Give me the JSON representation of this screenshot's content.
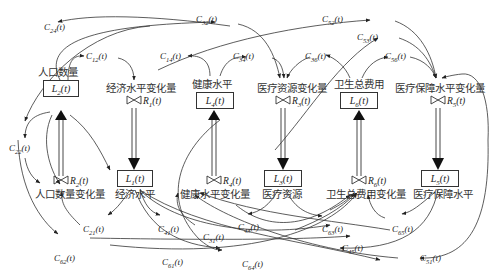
{
  "diagram": {
    "type": "system-dynamics-stock-flow",
    "stocks": [
      {
        "id": "L1",
        "sym": "L",
        "sub": "1",
        "arg": "(t)",
        "name": "经济水平"
      },
      {
        "id": "L2",
        "sym": "L",
        "sub": "2",
        "arg": "(t)",
        "name": "人口数量"
      },
      {
        "id": "L3",
        "sym": "L",
        "sub": "3",
        "arg": "(t)",
        "name": "医疗资源"
      },
      {
        "id": "L4",
        "sym": "L",
        "sub": "4",
        "arg": "(t)",
        "name": "健康水平"
      },
      {
        "id": "L5",
        "sym": "L",
        "sub": "5",
        "arg": "(t)",
        "name": "医疗保障水平"
      },
      {
        "id": "L6",
        "sym": "L",
        "sub": "6",
        "arg": "(t)",
        "name": "卫生总费用"
      }
    ],
    "rates": [
      {
        "id": "R1",
        "sym": "R",
        "sub": "1",
        "arg": "(t)",
        "name": "经济水平变化量"
      },
      {
        "id": "R2",
        "sym": "R",
        "sub": "2",
        "arg": "(t)",
        "name": "人口数量变化量"
      },
      {
        "id": "R3",
        "sym": "R",
        "sub": "3",
        "arg": "(t)",
        "name": "医疗资源变化量"
      },
      {
        "id": "R4",
        "sym": "R",
        "sub": "4",
        "arg": "(t)",
        "name": "健康水平变化量"
      },
      {
        "id": "R5",
        "sym": "R",
        "sub": "5",
        "arg": "(t)",
        "name": "医疗保障水平变化量"
      },
      {
        "id": "R6",
        "sym": "R",
        "sub": "6",
        "arg": "(t)",
        "name": "卫生总费用变化量"
      }
    ],
    "coefficients": {
      "C12": {
        "sym": "C",
        "sub": "12",
        "arg": "(t)"
      },
      "C14": {
        "sym": "C",
        "sub": "14",
        "arg": "(t)"
      },
      "C21": {
        "sym": "C",
        "sub": "21",
        "arg": "(t)"
      },
      "C22": {
        "sym": "C",
        "sub": "22",
        "arg": "(t)"
      },
      "C24": {
        "sym": "C",
        "sub": "24",
        "arg": "(t)"
      },
      "C31": {
        "sym": "C",
        "sub": "31",
        "arg": "(t)"
      },
      "C32": {
        "sym": "C",
        "sub": "32",
        "arg": "(t)"
      },
      "C34": {
        "sym": "C",
        "sub": "34",
        "arg": "(t)"
      },
      "C36": {
        "sym": "C",
        "sub": "36",
        "arg": "(t)"
      },
      "C41": {
        "sym": "C",
        "sub": "41",
        "arg": "(t)"
      },
      "C43": {
        "sym": "C",
        "sub": "43",
        "arg": "(t)"
      },
      "C45": {
        "sym": "C",
        "sub": "45",
        "arg": "(t)"
      },
      "C51": {
        "sym": "C",
        "sub": "51",
        "arg": "(t)"
      },
      "C52": {
        "sym": "C",
        "sub": "52",
        "arg": "(t)"
      },
      "C53": {
        "sym": "C",
        "sub": "53",
        "arg": "(t)"
      },
      "C56": {
        "sym": "C",
        "sub": "56",
        "arg": "(t)"
      },
      "C61": {
        "sym": "C",
        "sub": "61",
        "arg": "(t)"
      },
      "C62": {
        "sym": "C",
        "sub": "62",
        "arg": "(t)"
      },
      "C63": {
        "sym": "C",
        "sub": "63",
        "arg": "(t)"
      },
      "C64": {
        "sym": "C",
        "sub": "64",
        "arg": "(t)"
      },
      "C65": {
        "sym": "C",
        "sub": "65",
        "arg": "(t)"
      }
    }
  }
}
